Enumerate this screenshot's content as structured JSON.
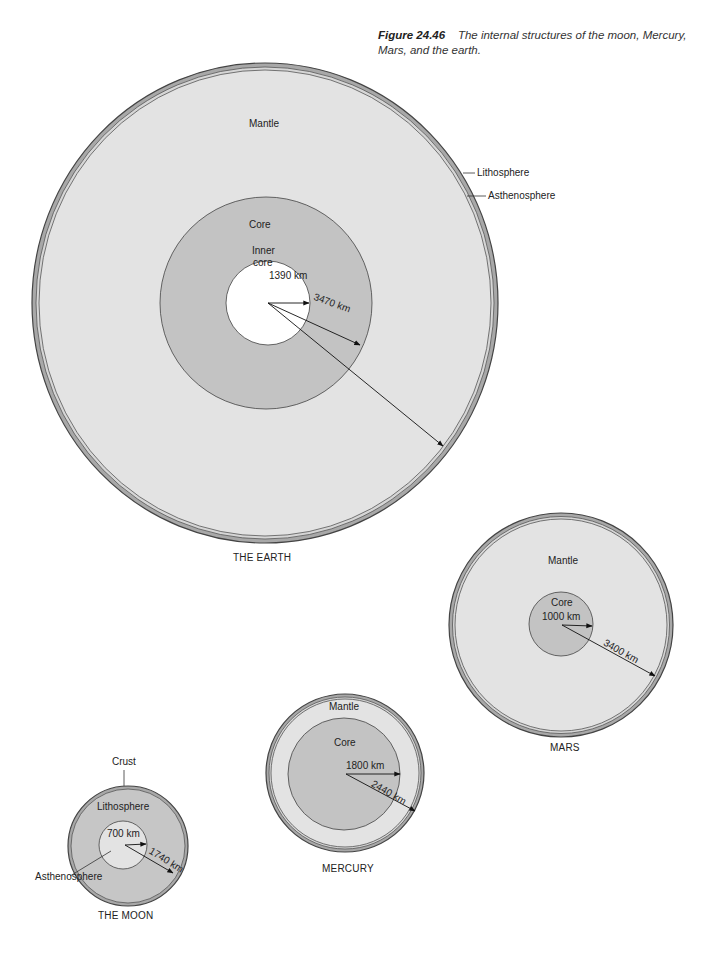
{
  "caption": {
    "figure_number": "Figure 24.46",
    "text": "The internal structures of the moon, Mercury, Mars, and the earth."
  },
  "colors": {
    "mantle": "#e2e2e2",
    "core": "#c3c3c3",
    "inner_core": "#ffffff",
    "outline": "#555555",
    "shell": "#a6a6a6"
  },
  "earth": {
    "title": "THE EARTH",
    "labels": {
      "mantle": "Mantle",
      "core": "Core",
      "inner_core_line1": "Inner",
      "inner_core_line2": "core",
      "lithosphere": "Lithosphere",
      "asthenosphere": "Asthenosphere",
      "inner_radius": "1390 km",
      "core_radius": "3470 km"
    }
  },
  "mars": {
    "title": "MARS",
    "labels": {
      "mantle": "Mantle",
      "core": "Core",
      "core_radius": "1000 km",
      "planet_radius": "3400 km"
    }
  },
  "mercury": {
    "title": "MERCURY",
    "labels": {
      "mantle": "Mantle",
      "core": "Core",
      "core_radius": "1800 km",
      "planet_radius": "2440 km"
    }
  },
  "moon": {
    "title": "THE MOON",
    "labels": {
      "crust": "Crust",
      "lithosphere": "Lithosphere",
      "asthenosphere": "Asthenosphere",
      "inner_radius": "700 km",
      "planet_radius": "1740 km"
    }
  }
}
